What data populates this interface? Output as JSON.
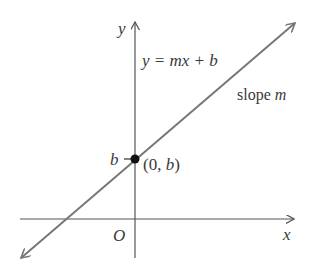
{
  "diagram": {
    "equation": "y = mx + b",
    "slope_label": "slope m",
    "slope_word": "slope",
    "slope_var": "m",
    "intercept_label": "b",
    "point_label": "(0, b)",
    "point_open": "(0, ",
    "point_var": "b",
    "point_close": ")",
    "x_axis_label": "x",
    "y_axis_label": "y",
    "origin_label": "O",
    "colors": {
      "axis": "#555555",
      "line": "#777777",
      "point": "#111111",
      "text": "#3a3a3a"
    }
  }
}
